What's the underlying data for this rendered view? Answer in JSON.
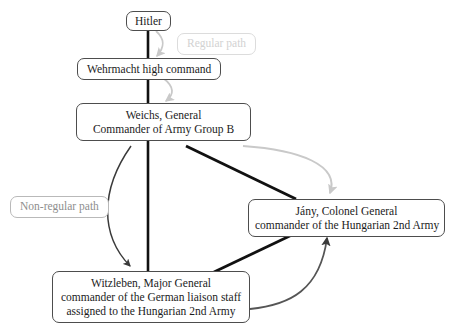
{
  "diagram": {
    "nodes": {
      "hitler": {
        "id": "hitler",
        "lines": [
          "Hitler"
        ]
      },
      "wehrmacht": {
        "id": "wehrmacht",
        "lines": [
          "Wehrmacht high command"
        ]
      },
      "weichs": {
        "id": "weichs",
        "lines": [
          "Weichs, General",
          "Commander of Army Group B"
        ],
        "line1": "Weichs, General",
        "line2": "Commander of Army Group B"
      },
      "jany": {
        "id": "jany",
        "lines": [
          "Jány, Colonel General",
          "commander of the Hungarian 2nd Army"
        ],
        "line1": "Jány, Colonel General",
        "line2": "commander of the Hungarian 2nd Army"
      },
      "witzleben": {
        "id": "witzleben",
        "lines": [
          "Witzleben, Major General",
          "commander of the German liaison staff",
          "assigned to the Hungarian 2nd Army"
        ],
        "line1": "Witzleben, Major General",
        "line2": "commander of the German liaison staff",
        "line3": "assigned to the Hungarian 2nd Army"
      }
    },
    "legend": {
      "regular": "Regular path",
      "nonregular": "Non-regular path"
    },
    "colors": {
      "regular_path": "#c9c9c9",
      "nonregular_path": "#3a3a3a",
      "spine": "#111111",
      "box_border": "#4d4d4d",
      "text": "#1b1b1b",
      "background": "#ffffff"
    },
    "edges": [
      {
        "from": "hitler",
        "to": "wehrmacht",
        "style": "regular",
        "shape": "curve"
      },
      {
        "from": "wehrmacht",
        "to": "weichs",
        "style": "regular",
        "shape": "curve"
      },
      {
        "from": "weichs",
        "to": "jany",
        "style": "regular",
        "shape": "curve"
      },
      {
        "from": "hitler",
        "to": "witzleben",
        "style": "spine",
        "shape": "straight"
      },
      {
        "from": "weichs",
        "to": "witzleben",
        "style": "nonregular",
        "shape": "curve"
      },
      {
        "from": "weichs",
        "to": "jany",
        "style": "nonregular",
        "shape": "straight"
      },
      {
        "from": "witzleben",
        "to": "jany",
        "style": "nonregular",
        "shape": "curve"
      },
      {
        "from": "jany",
        "to": "witzleben",
        "style": "nonregular",
        "shape": "straight"
      }
    ]
  }
}
